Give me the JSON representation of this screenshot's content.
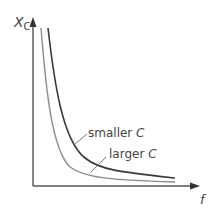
{
  "diagram": {
    "y_axis_label": "X",
    "y_axis_subscript": "C",
    "x_axis_label": "f",
    "curves": [
      {
        "name": "smaller C",
        "label_prefix": "smaller ",
        "label_var": "C",
        "color": "#3a3a3a"
      },
      {
        "name": "larger C",
        "label_prefix": "larger ",
        "label_var": "C",
        "color": "#8a8a8a"
      }
    ],
    "colors": {
      "axis": "#555555",
      "text": "#444444"
    }
  }
}
